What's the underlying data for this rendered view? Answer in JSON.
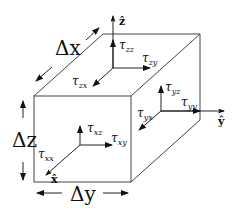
{
  "diagram": {
    "type": "stress-element-cube",
    "dimensions": {
      "dx": "Δx",
      "dy": "Δy",
      "dz": "Δz"
    },
    "axes": {
      "x": "x̂",
      "y": "ŷ",
      "z": "ẑ"
    },
    "stress_labels": {
      "zz": "τzz",
      "zy": "τzy",
      "zx": "τzx",
      "yz": "τyz",
      "yy": "τyy",
      "yx": "τyx",
      "xz": "τxz",
      "xy": "τxy",
      "xx": "τxx"
    },
    "stress_parts": {
      "tau": "τ",
      "zz": "zz",
      "zy": "zy",
      "zx": "zx",
      "yz": "yz",
      "yy": "yy",
      "yx": "yx",
      "xz": "xz",
      "xy": "xy",
      "xx": "xx"
    }
  }
}
